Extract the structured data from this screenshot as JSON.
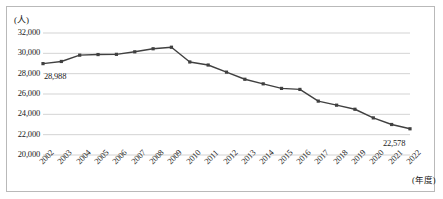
{
  "chart_data": {
    "type": "line",
    "title": "",
    "xlabel": "(年度)",
    "ylabel": "(人)",
    "ylim": [
      20000,
      32000
    ],
    "ytick_values": [
      20000,
      22000,
      24000,
      26000,
      28000,
      30000,
      32000
    ],
    "ytick_labels": [
      "20,000",
      "22,000",
      "24,000",
      "26,000",
      "28,000",
      "30,000",
      "32,000"
    ],
    "grid": true,
    "legend": "none",
    "categories": [
      "2002",
      "2003",
      "2004",
      "2005",
      "2006",
      "2007",
      "2008",
      "2009",
      "2010",
      "2011",
      "2012",
      "2013",
      "2014",
      "2015",
      "2016",
      "2017",
      "2018",
      "2019",
      "2020",
      "2021",
      "2022"
    ],
    "values": [
      28988,
      29200,
      29820,
      29880,
      29900,
      30150,
      30450,
      30600,
      29150,
      28850,
      28150,
      27450,
      27000,
      26550,
      26450,
      25300,
      24900,
      24500,
      23650,
      23000,
      22578
    ],
    "series": [
      {
        "name": "人数",
        "color": "#404040",
        "marker": "square",
        "values": [
          28988,
          29200,
          29820,
          29880,
          29900,
          30150,
          30450,
          30600,
          29150,
          28850,
          28150,
          27450,
          27000,
          26550,
          26450,
          25300,
          24900,
          24500,
          23650,
          23000,
          22578
        ]
      }
    ],
    "annotations": [
      {
        "name": "first-point-label",
        "text": "28,988",
        "category": "2002",
        "value": 28988
      },
      {
        "name": "last-point-label",
        "text": "22,578",
        "category": "2022",
        "value": 22578
      }
    ]
  },
  "colors": {
    "line": "#404040",
    "grid": "#c8c8c8",
    "border": "#b9b9b9",
    "text": "#1a1a1a"
  }
}
